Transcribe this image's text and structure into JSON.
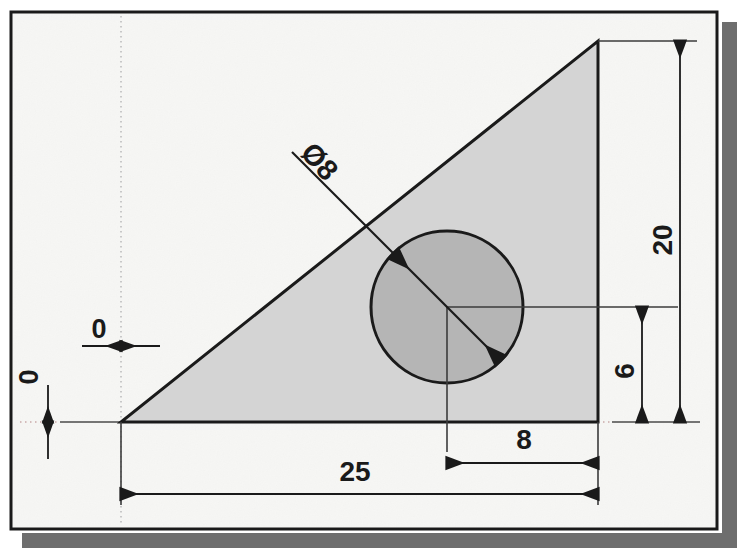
{
  "drawing": {
    "title": "Right triangle with circular hole - dimensioned engineering drawing",
    "sheet": {
      "paper_color": "#f7f7f5",
      "border_color": "#1a1a1a",
      "shadow_color": "#6e6e6e"
    },
    "colors": {
      "triangle_fill": "#d4d4d4",
      "circle_fill": "#b5b5b5",
      "outline": "#1a1a1a",
      "dimension_line": "#2b2b2b",
      "center_line": "#c8c8c8"
    },
    "shapes": {
      "triangle": {
        "name": "triangle-profile",
        "vertices": "121,422 598,422 598,41",
        "base_length": 25,
        "height": 20
      },
      "circle": {
        "name": "circle-hole",
        "cx": 447,
        "cy": 307,
        "r": 76,
        "diameter": 8
      }
    },
    "dimensions": [
      {
        "id": "dia8",
        "label": "Ø8",
        "value": "Ø8",
        "orientation": "leader-diagonal",
        "x": 318,
        "y": 163,
        "rotation": 50
      },
      {
        "id": "h20",
        "label": "20",
        "value": "20",
        "orientation": "vertical",
        "x": 665,
        "y": 240,
        "rotation": -90
      },
      {
        "id": "h6",
        "label": "6",
        "value": "6",
        "orientation": "vertical",
        "x": 627,
        "y": 371,
        "rotation": -90
      },
      {
        "id": "w25",
        "label": "25",
        "value": "25",
        "orientation": "horizontal",
        "x": 355,
        "y": 478,
        "rotation": 0
      },
      {
        "id": "w8",
        "label": "8",
        "value": "8",
        "orientation": "horizontal",
        "x": 524,
        "y": 449,
        "rotation": 0
      },
      {
        "id": "zerox",
        "label": "0",
        "value": "0",
        "orientation": "horizontal",
        "x": 99,
        "y": 336,
        "rotation": 0
      },
      {
        "id": "zeroy",
        "label": "0",
        "value": "0",
        "orientation": "vertical",
        "x": 31,
        "y": 377,
        "rotation": -90
      }
    ]
  }
}
